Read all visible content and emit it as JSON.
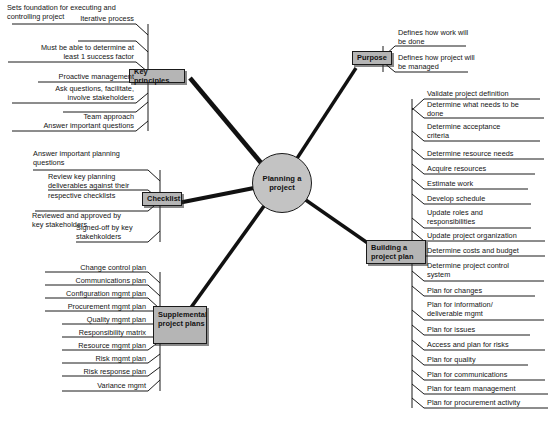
{
  "diagram": {
    "title_note": "Sets foundation for executing and\ncontrolling project",
    "center": {
      "label": "Planning a\nproject"
    },
    "colors": {
      "node_fill": "#b5b5b5",
      "center_fill": "#c3c3c3",
      "stroke": "#1a1a1a",
      "background": "#ffffff"
    },
    "branches": [
      {
        "id": "key-principles",
        "label": "Key principles",
        "side": "left",
        "items": [
          "Iterative process",
          "Must be able to determine at\nleast 1 success factor",
          "Proactive management",
          "Ask questions, facilitate,\ninvolve stakeholders",
          "Team approach",
          "Answer important questions"
        ]
      },
      {
        "id": "checklist",
        "label": "Checklist",
        "side": "left",
        "items": [
          "Answer important planning\nquestions",
          "Review key planning\ndeliverables against their\nrespective checklists",
          "Reviewed and approved  by\nkey stakeholders",
          "Signed-off by key\nstakehkolders"
        ]
      },
      {
        "id": "supplemental-project-plans",
        "label": "Supplemental\nproject\nplans",
        "side": "left",
        "items": [
          "Change control plan",
          "Communications plan",
          "Configuration mgmt plan",
          "Procurement mgmt plan",
          "Quality mgmt plan",
          "Responsibility matrix",
          "Resource mgmt plan",
          "Risk mgmt plan",
          "Risk response plan",
          "Variance mgmt"
        ]
      },
      {
        "id": "purpose",
        "label": "Purpose",
        "side": "right",
        "items": [
          "Defines how work will\nbe done",
          "Defines how project will\nbe managed"
        ]
      },
      {
        "id": "building-a-project-plan",
        "label": "Building a project\nplan",
        "side": "right",
        "items": [
          "Validate project definition",
          "Determine what needs to be\ndone",
          "Determine acceptance\ncriteria",
          "Determine resource needs",
          "Acquire resources",
          "Estimate work",
          "Develop schedule",
          "Update roles and\nresponsibilities",
          "Update project organization",
          "Determine costs and budget",
          "Determine project control\nsystem",
          "Plan for changes",
          "Plan for information/\ndeliverable mgmt",
          "Plan for issues",
          "Access and plan for risks",
          "Plan for quality",
          "Plan for communications",
          "Plan for team management",
          "Plan for procurement activity"
        ]
      }
    ]
  }
}
